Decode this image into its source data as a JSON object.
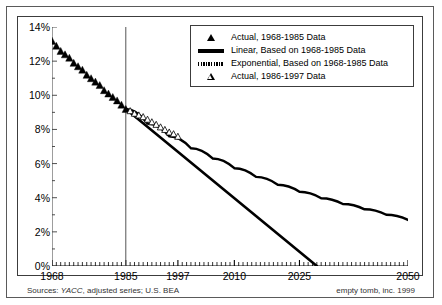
{
  "chart_data": {
    "type": "line",
    "title": "",
    "xlabel": "",
    "ylabel": "",
    "xlim": [
      1968,
      2050
    ],
    "ylim": [
      0,
      14
    ],
    "y_ticks": [
      "0%",
      "2%",
      "4%",
      "6%",
      "8%",
      "10%",
      "12%",
      "14%"
    ],
    "y_tick_values": [
      0,
      2,
      4,
      6,
      8,
      10,
      12,
      14
    ],
    "x_ticks": [
      "1968",
      "1985",
      "1997",
      "2010",
      "2025",
      "2050"
    ],
    "x_tick_values": [
      1968,
      1985,
      1997,
      2010,
      2025,
      2050
    ],
    "minor_x_tick_interval": 1,
    "grid": false,
    "legend_position": "top-right",
    "reference_line_x": 1985,
    "series": [
      {
        "name": "Actual, 1968-1985 Data",
        "marker": "filled-triangle",
        "x": [
          1968,
          1969,
          1970,
          1971,
          1972,
          1973,
          1974,
          1975,
          1976,
          1977,
          1978,
          1979,
          1980,
          1981,
          1982,
          1983,
          1984,
          1985
        ],
        "values": [
          13.2,
          12.9,
          12.6,
          12.4,
          12.2,
          11.9,
          11.7,
          11.5,
          11.2,
          11.0,
          10.8,
          10.6,
          10.3,
          10.1,
          9.9,
          9.7,
          9.45,
          9.2
        ]
      },
      {
        "name": "Linear, Based on 1968-1985 Data",
        "marker": "solid-line",
        "x": [
          1985,
          2029
        ],
        "values": [
          9.2,
          0.0
        ]
      },
      {
        "name": "Exponential, Based on 1968-1985 Data",
        "marker": "hatched-line",
        "x": [
          1985,
          1990,
          1995,
          2000,
          2005,
          2010,
          2015,
          2020,
          2025,
          2030,
          2035,
          2040,
          2045,
          2050
        ],
        "values": [
          9.2,
          8.35,
          7.6,
          6.9,
          6.3,
          5.73,
          5.22,
          4.76,
          4.35,
          3.97,
          3.63,
          3.32,
          3.0,
          2.7
        ]
      },
      {
        "name": "Actual, 1986-1997 Data",
        "marker": "open-triangle",
        "x": [
          1986,
          1987,
          1988,
          1989,
          1990,
          1991,
          1992,
          1993,
          1994,
          1995,
          1996,
          1997
        ],
        "values": [
          9.1,
          8.95,
          8.85,
          8.75,
          8.6,
          8.45,
          8.3,
          8.15,
          8.0,
          7.85,
          7.75,
          7.6
        ]
      }
    ]
  },
  "legend": {
    "items": [
      {
        "label": "Actual, 1968-1985 Data",
        "key": "filled-triangle"
      },
      {
        "label": "Linear, Based on 1968-1985 Data",
        "key": "solid-line"
      },
      {
        "label": "Exponential, Based on 1968-1985 Data",
        "key": "hatched-line"
      },
      {
        "label": "Actual, 1986-1997 Data",
        "key": "open-triangle"
      }
    ]
  },
  "footer": {
    "sources_prefix": "Sources: ",
    "sources_italic": "YACC",
    "sources_suffix": ", adjusted series; U.S. BEA",
    "credit": "empty tomb, inc. 1999"
  },
  "colors": {
    "ink": "#000000",
    "frame": "#3c3c3c",
    "outer_frame": "#5a5a5a",
    "background": "#ffffff"
  }
}
